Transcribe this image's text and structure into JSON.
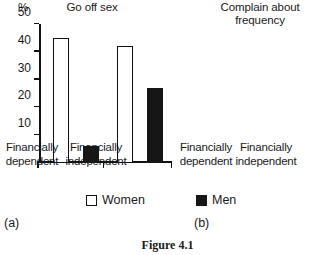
{
  "figure": {
    "caption": "Figure 4.1",
    "unit_label": "%",
    "panel_letters": {
      "a": "(a)",
      "b": "(b)"
    }
  },
  "legend": {
    "position": "bottom-center",
    "items": [
      {
        "label": "Women",
        "swatch": "open-square-icon",
        "color": "#ffffff"
      },
      {
        "label": "Men",
        "swatch": "filled-square-icon",
        "color": "#161616"
      }
    ]
  },
  "chart_data": [
    {
      "type": "bar",
      "panel": "(a)",
      "title": "Go off sex",
      "xlabel": "",
      "ylabel": "%",
      "ylim": [
        0,
        50
      ],
      "yticks": [
        10,
        20,
        30,
        40,
        50
      ],
      "ytick_labels": [
        "10",
        "20",
        "30",
        "40",
        "50"
      ],
      "grid": false,
      "legend_position": "bottom",
      "categories": [
        "Financially dependent",
        "Financially independent"
      ],
      "category_lines": [
        [
          "Financially",
          "dependent"
        ],
        [
          "Financially",
          "independent"
        ]
      ],
      "series": [
        {
          "name": "Women",
          "color": "#ffffff",
          "values": [
            45,
            42
          ]
        },
        {
          "name": "Men",
          "color": "#161616",
          "values": [
            6,
            27
          ]
        }
      ]
    },
    {
      "type": "bar",
      "panel": "(b)",
      "title": "Complain about frequency",
      "title_lines": [
        "Complain about",
        "frequency"
      ],
      "xlabel": "",
      "ylabel": "",
      "ylim": [
        0,
        50
      ],
      "yticks": [
        10,
        20,
        30,
        40,
        50
      ],
      "ytick_labels": [
        "",
        "",
        "",
        "",
        ""
      ],
      "grid": false,
      "legend_position": "bottom",
      "categories": [
        "Financially dependent",
        "Financially independent"
      ],
      "category_lines": [
        [
          "Financially",
          "dependent"
        ],
        [
          "Financially",
          "independent"
        ]
      ],
      "series": [
        {
          "name": "Women",
          "color": "#ffffff",
          "values": [
            13,
            24
          ]
        },
        {
          "name": "Men",
          "color": "#161616",
          "values": [
            47,
            32
          ]
        }
      ]
    }
  ]
}
